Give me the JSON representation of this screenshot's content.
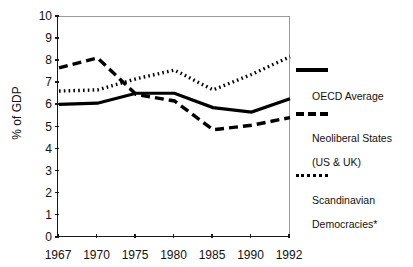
{
  "chart_data": {
    "type": "line",
    "title": "",
    "xlabel": "",
    "ylabel": "% of GDP",
    "categories": [
      "1967",
      "1970",
      "1975",
      "1980",
      "1985",
      "1990",
      "1992"
    ],
    "x_tick_labels": [
      "1967",
      "1970",
      "1975",
      "1980",
      "1985",
      "1990",
      "1992"
    ],
    "y_tick_labels": [
      "0",
      "1",
      "2",
      "3",
      "4",
      "5",
      "6",
      "7",
      "8",
      "9",
      "10"
    ],
    "ylim": [
      0,
      10
    ],
    "y_tick_step": 1,
    "grid": false,
    "legend_position": "right",
    "series": [
      {
        "name": "OECD Average",
        "style": "solid",
        "color": "#000000",
        "values": [
          6.05,
          6.1,
          6.55,
          6.55,
          5.9,
          5.7,
          6.3
        ]
      },
      {
        "name": "Neoliberal States (US & UK)",
        "style": "dashed",
        "color": "#000000",
        "values": [
          7.7,
          8.15,
          6.5,
          6.2,
          4.9,
          5.1,
          5.45
        ]
      },
      {
        "name": "Scandinavian Democracies*",
        "style": "dotted",
        "color": "#000000",
        "values": [
          6.65,
          6.7,
          7.2,
          7.6,
          6.7,
          7.4,
          8.2
        ]
      }
    ]
  },
  "legend": {
    "entries": [
      {
        "key": "solid",
        "label": "OECD Average"
      },
      {
        "key": "dashed",
        "label_line1": "Neoliberal States",
        "label_line2": "(US & UK)"
      },
      {
        "key": "dotted",
        "label_line1": "Scandinavian",
        "label_line2": "Democracies*"
      }
    ]
  },
  "axis": {
    "y_title": "% of GDP"
  }
}
